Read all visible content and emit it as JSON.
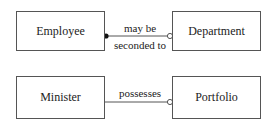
{
  "relationships": [
    {
      "from": "Employee",
      "to": "Department",
      "label_top": "may be",
      "label_bottom": "seconded to",
      "from_end": "filled-dot",
      "to_end": "open-circle"
    },
    {
      "from": "Minister",
      "to": "Portfolio",
      "label_top": "possesses",
      "from_end": "none",
      "to_end": "open-circle"
    }
  ]
}
